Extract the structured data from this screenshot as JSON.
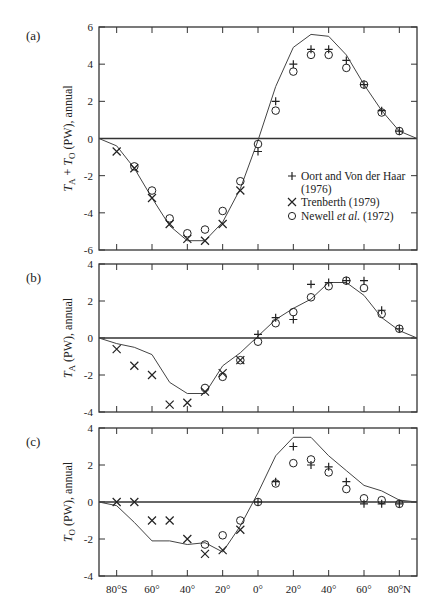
{
  "chart_data": [
    {
      "panel": "(a)",
      "type": "line+scatter",
      "ylabel": "T_A + T_O (PW), annual",
      "ylim": [
        -6,
        6
      ],
      "yticks": [
        -6,
        -4,
        -2,
        0,
        2,
        4,
        6
      ],
      "xlim": [
        -90,
        90
      ],
      "curve": {
        "x": [
          -90,
          -80,
          -70,
          -60,
          -50,
          -40,
          -30,
          -20,
          -10,
          0,
          10,
          20,
          30,
          40,
          50,
          60,
          70,
          80,
          90
        ],
        "y": [
          0,
          -0.4,
          -1.6,
          -3.2,
          -4.7,
          -5.5,
          -5.5,
          -4.5,
          -2.7,
          -0.1,
          2.8,
          4.9,
          5.6,
          5.5,
          4.5,
          2.9,
          1.5,
          0.4,
          0
        ]
      },
      "series": [
        {
          "name": "Oort and Von der Haar (1976)",
          "marker": "+",
          "x": [
            0,
            10,
            20,
            30,
            40,
            50,
            60,
            70,
            80
          ],
          "y": [
            -0.7,
            2.0,
            4.0,
            4.8,
            4.8,
            4.2,
            2.9,
            1.5,
            0.4
          ]
        },
        {
          "name": "Trenberth (1979)",
          "marker": "x",
          "x": [
            -80,
            -70,
            -60,
            -50,
            -40,
            -30,
            -20,
            -10
          ],
          "y": [
            -0.7,
            -1.6,
            -3.2,
            -4.6,
            -5.4,
            -5.5,
            -4.6,
            -2.8
          ]
        },
        {
          "name": "Newell et al. (1972)",
          "marker": "o",
          "x": [
            -70,
            -60,
            -50,
            -40,
            -30,
            -20,
            -10,
            0,
            10,
            20,
            30,
            40,
            50,
            60,
            70,
            80
          ],
          "y": [
            -1.5,
            -2.8,
            -4.3,
            -5.1,
            -4.9,
            -3.9,
            -2.3,
            -0.3,
            1.5,
            3.6,
            4.5,
            4.5,
            3.8,
            2.9,
            1.4,
            0.4
          ]
        }
      ]
    },
    {
      "panel": "(b)",
      "type": "line+scatter",
      "ylabel": "T_A (PW), annual",
      "ylim": [
        -4,
        4
      ],
      "yticks": [
        -4,
        -2,
        0,
        2,
        4
      ],
      "xlim": [
        -90,
        90
      ],
      "curve": {
        "x": [
          -90,
          -80,
          -70,
          -60,
          -50,
          -40,
          -30,
          -20,
          -10,
          0,
          10,
          20,
          30,
          40,
          50,
          60,
          70,
          80,
          90
        ],
        "y": [
          0,
          -0.3,
          -0.5,
          -0.9,
          -2.4,
          -3.0,
          -3.0,
          -1.5,
          -0.8,
          0.1,
          1.0,
          1.6,
          2.1,
          3.0,
          3.0,
          2.3,
          1.1,
          0.4,
          0
        ]
      },
      "series": [
        {
          "name": "Oort and Von der Haar (1976)",
          "marker": "+",
          "x": [
            0,
            10,
            20,
            30,
            40,
            50,
            60,
            70,
            80
          ],
          "y": [
            0.2,
            1.1,
            1.0,
            2.9,
            3.0,
            3.1,
            3.1,
            1.5,
            0.5
          ]
        },
        {
          "name": "Trenberth (1979)",
          "marker": "x",
          "x": [
            -80,
            -70,
            -60,
            -50,
            -40,
            -30,
            -20,
            -10
          ],
          "y": [
            -0.6,
            -1.5,
            -2.0,
            -3.6,
            -3.5,
            -2.9,
            -1.9,
            -1.2
          ]
        },
        {
          "name": "Newell et al. (1972)",
          "marker": "o",
          "x": [
            -30,
            -20,
            -10,
            0,
            10,
            20,
            30,
            40,
            50,
            60,
            70,
            80
          ],
          "y": [
            -2.7,
            -2.1,
            -1.2,
            -0.2,
            0.8,
            1.4,
            2.2,
            2.8,
            3.1,
            2.7,
            1.3,
            0.5
          ]
        }
      ]
    },
    {
      "panel": "(c)",
      "type": "line+scatter",
      "ylabel": "T_O (PW), annual",
      "ylim": [
        -4,
        4
      ],
      "yticks": [
        -4,
        -2,
        0,
        2,
        4
      ],
      "xlim": [
        -90,
        90
      ],
      "xticks": [
        "80°S",
        "60°",
        "40°",
        "20°",
        "0°",
        "20°",
        "40°",
        "60°",
        "80°N"
      ],
      "curve": {
        "x": [
          -90,
          -80,
          -70,
          -60,
          -50,
          -40,
          -30,
          -20,
          -10,
          0,
          10,
          20,
          30,
          40,
          50,
          60,
          70,
          80,
          90
        ],
        "y": [
          0,
          -0.2,
          -1.1,
          -2.1,
          -2.1,
          -2.3,
          -2.2,
          -2.7,
          -1.3,
          0.5,
          2.5,
          3.5,
          3.5,
          2.5,
          1.7,
          0.9,
          0.6,
          0.1,
          0
        ]
      },
      "series": [
        {
          "name": "Oort and Von der Haar (1976)",
          "marker": "+",
          "x": [
            0,
            10,
            20,
            30,
            40,
            50,
            60,
            70,
            80
          ],
          "y": [
            0,
            1.1,
            3.0,
            2.0,
            1.9,
            1.1,
            -0.1,
            -0.1,
            -0.1
          ]
        },
        {
          "name": "Trenberth (1979)",
          "marker": "x",
          "x": [
            -80,
            -70,
            -60,
            -50,
            -40,
            -30,
            -20,
            -10
          ],
          "y": [
            0,
            0,
            -1.0,
            -1.0,
            -2.0,
            -2.8,
            -2.6,
            -1.5
          ]
        },
        {
          "name": "Newell et al. (1972)",
          "marker": "o",
          "x": [
            -30,
            -20,
            -10,
            0,
            10,
            20,
            30,
            40,
            50,
            60,
            70,
            80
          ],
          "y": [
            -2.3,
            -1.8,
            -1.0,
            0,
            1.0,
            2.1,
            2.3,
            1.6,
            0.7,
            0.2,
            0.1,
            -0.1
          ]
        }
      ]
    }
  ],
  "labels": {
    "panel_a": "(a)",
    "panel_b": "(b)",
    "panel_c": "(c)",
    "legend": [
      "Oort and Von der Haar",
      "(1976)",
      "Trenberth (1979)",
      "Newell et al. (1972)"
    ]
  }
}
